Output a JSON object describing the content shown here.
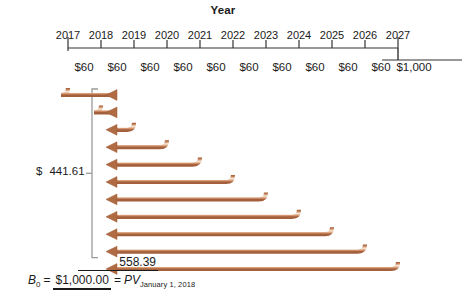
{
  "chart_data": {
    "type": "timeline",
    "title": "Year",
    "axis_label": "Year",
    "categories": [
      "2017",
      "2018",
      "2019",
      "2020",
      "2021",
      "2022",
      "2023",
      "2024",
      "2025",
      "2026",
      "2027"
    ],
    "cash_flow_labels": [
      "$60",
      "$60",
      "$60",
      "$60",
      "$60",
      "$60",
      "$60",
      "$60",
      "$60",
      "$60",
      "$1,000"
    ],
    "cash_flow_values": [
      60,
      60,
      60,
      60,
      60,
      60,
      60,
      60,
      60,
      60,
      1000
    ],
    "arrow_count": 11,
    "arrow_direction": "left",
    "annotations": {
      "interest_pv_label": "$",
      "interest_pv_value": "441.61",
      "principal_pv_value": "558.39",
      "balance_symbol": "B",
      "balance_subscript": "0",
      "balance_equals": "=",
      "balance_total": "$1,000.00",
      "balance_equals2": "=",
      "balance_pv_symbol": "PV",
      "balance_pv_subscript": "January 1, 2018"
    },
    "colors": {
      "arrow_dark": "#a4603c",
      "arrow_mid": "#c07a50",
      "arrow_light": "#f4e3d2",
      "axis": "#333333",
      "bracket": "#9a9a9a",
      "text": "#1a1a1a",
      "background": "#ffffff"
    },
    "layout": {
      "axis_y": 48,
      "tick_x": [
        68,
        101,
        134,
        167,
        200,
        233,
        266,
        299,
        332,
        365,
        398
      ],
      "arrow_top_y": 95,
      "arrow_spacing": 17.4,
      "arrow_head_x": 108
    }
  }
}
